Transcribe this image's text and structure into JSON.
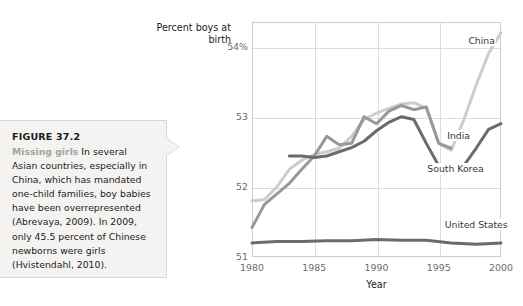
{
  "caption": {
    "figure_number": "FIGURE 37.2",
    "lead_in": "Missing girls",
    "body": "In several Asian countries, especially in China, which has mandated one-child families, boy babies have been overrepresented (Abrevaya, 2009). In 2009, only 45.5 percent of Chinese newborns were girls (Hvistendahl, 2010)."
  },
  "chart_data": {
    "type": "line",
    "title": "",
    "ylabel": "Percent boys at birth",
    "xlabel": "Year",
    "xlim": [
      1980,
      2000
    ],
    "ylim": [
      51,
      54.35
    ],
    "xticks": [
      "1980",
      "1985",
      "1990",
      "1995",
      "2000"
    ],
    "yticks": [
      "51",
      "52",
      "53",
      "54%"
    ],
    "ytick_values": [
      51,
      52,
      53,
      54
    ],
    "grid": true,
    "legend_position": "inline-right",
    "colors": {
      "china": "#cfcdc9",
      "india": "#9b9894",
      "south_korea": "#6e6b67",
      "united_states": "#6e6b67"
    },
    "series": [
      {
        "name": "China",
        "color": "#cfcdc9",
        "x": [
          1980,
          1981,
          1982,
          1983,
          1984,
          1985,
          1986,
          1987,
          1988,
          1989,
          1990,
          1991,
          1992,
          1993,
          1994,
          1995,
          1996,
          1997,
          1998,
          1999,
          2000
        ],
        "values": [
          51.8,
          51.82,
          52.0,
          52.25,
          52.38,
          52.46,
          52.5,
          52.55,
          52.72,
          52.96,
          53.05,
          53.12,
          53.18,
          53.2,
          53.12,
          52.62,
          52.52,
          52.95,
          53.45,
          53.9,
          54.2
        ]
      },
      {
        "name": "India",
        "color": "#9b9894",
        "x": [
          1980,
          1981,
          1982,
          1983,
          1984,
          1985,
          1986,
          1987,
          1988,
          1989,
          1990,
          1991,
          1992,
          1993,
          1994,
          1995,
          1996
        ],
        "values": [
          51.42,
          51.75,
          51.9,
          52.05,
          52.25,
          52.44,
          52.72,
          52.6,
          52.62,
          53.0,
          52.9,
          53.08,
          53.16,
          53.1,
          53.14,
          52.62,
          52.55
        ]
      },
      {
        "name": "South Korea",
        "color": "#6e6b67",
        "x": [
          1983,
          1984,
          1985,
          1986,
          1987,
          1988,
          1989,
          1990,
          1991,
          1992,
          1993,
          1994,
          1995,
          1996,
          1997,
          1998,
          1999,
          2000
        ],
        "values": [
          52.44,
          52.44,
          52.42,
          52.44,
          52.5,
          52.56,
          52.65,
          52.8,
          52.92,
          53.0,
          52.96,
          52.62,
          52.3,
          52.22,
          52.3,
          52.55,
          52.82,
          52.9
        ]
      },
      {
        "name": "United States",
        "color": "#6e6b67",
        "x": [
          1980,
          1982,
          1984,
          1986,
          1988,
          1990,
          1992,
          1994,
          1996,
          1998,
          2000
        ],
        "values": [
          51.2,
          51.22,
          51.22,
          51.23,
          51.23,
          51.25,
          51.24,
          51.24,
          51.2,
          51.18,
          51.2
        ]
      }
    ],
    "annotations": [
      {
        "label": "China",
        "x": 1997.3,
        "y": 54.08
      },
      {
        "label": "India",
        "x": 1995.6,
        "y": 52.72
      },
      {
        "label": "South Korea",
        "x": 1994.0,
        "y": 52.25
      },
      {
        "label": "United States",
        "x": 1995.4,
        "y": 51.45
      }
    ]
  }
}
